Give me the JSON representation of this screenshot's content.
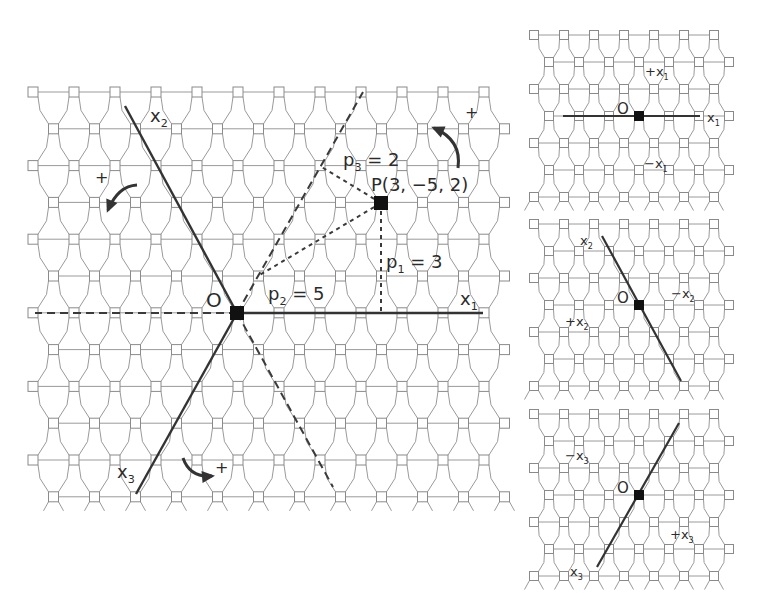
{
  "colors": {
    "background": "#ffffff",
    "lattice_line": "#9a9a9a",
    "node_fill": "#ffffff",
    "node_stroke": "#8a8a8a",
    "axis": "#333333",
    "dashed": "#3a3a3a",
    "marker": "#111111",
    "text": "#2b2b2b"
  },
  "main_panel": {
    "lattice": {
      "rows": 12,
      "cols": 12,
      "x0": 33,
      "y0": 92,
      "dx": 41,
      "dy": 36.8,
      "node_size": 10,
      "odd_row_offset": 20.5
    },
    "origin": {
      "label": "O",
      "x": 237,
      "y": 313
    },
    "point": {
      "label": "P(3, −5, 2)",
      "x": 381,
      "y": 203
    },
    "axes": [
      {
        "name": "x1",
        "label": "x",
        "sub": "1",
        "from": [
          237,
          313
        ],
        "to": [
          483,
          313
        ],
        "label_pos": [
          460,
          305
        ]
      },
      {
        "name": "x2",
        "label": "x",
        "sub": "2",
        "from": [
          237,
          313
        ],
        "to": [
          125,
          106
        ],
        "label_pos": [
          150,
          122
        ]
      },
      {
        "name": "x3",
        "label": "x",
        "sub": "3",
        "from": [
          237,
          313
        ],
        "to": [
          136,
          494
        ],
        "label_pos": [
          117,
          478
        ]
      }
    ],
    "dashed_extensions": [
      {
        "name": "neg-x1",
        "from": [
          237,
          313
        ],
        "to": [
          35,
          313
        ]
      },
      {
        "name": "x3-extension",
        "from": [
          237,
          313
        ],
        "to": [
          363,
          92
        ]
      },
      {
        "name": "x2-extension",
        "from": [
          237,
          313
        ],
        "to": [
          333,
          487
        ]
      }
    ],
    "projections": [
      {
        "name": "p1",
        "label": "p",
        "sub": "1",
        "value": "= 3",
        "from": [
          381,
          203
        ],
        "to": [
          381,
          313
        ],
        "label_pos": [
          386,
          268
        ]
      },
      {
        "name": "p2",
        "label": "p",
        "sub": "2",
        "value": "= 5",
        "from": [
          381,
          203
        ],
        "to": [
          258,
          276
        ],
        "label_pos": [
          268,
          300
        ]
      },
      {
        "name": "p3",
        "label": "p",
        "sub": "3",
        "value": "= 2",
        "from": [
          381,
          203
        ],
        "to": [
          320,
          166
        ],
        "label_pos": [
          343,
          166
        ]
      }
    ],
    "rotation_arrows": [
      {
        "name": "rotation-arrow-top-right",
        "sign": "+",
        "sign_pos": [
          465,
          118
        ],
        "path": "M458 168 Q462 140 434 128",
        "head": [
          434,
          128
        ]
      },
      {
        "name": "rotation-arrow-left",
        "sign": "+",
        "sign_pos": [
          95,
          183
        ],
        "path": "M137 185 Q118 186 108 210",
        "head": [
          108,
          210
        ]
      },
      {
        "name": "rotation-arrow-bottom",
        "sign": "+",
        "sign_pos": [
          215,
          473
        ],
        "path": "M183 458 Q190 478 212 476",
        "head": [
          212,
          476
        ]
      }
    ]
  },
  "side_panels": [
    {
      "name": "x1-panel",
      "lattice": {
        "rows": 7,
        "cols": 7,
        "x0": 534,
        "y0": 35,
        "dx": 30,
        "dy": 27,
        "node_size": 9,
        "odd_row_offset": 15
      },
      "origin": {
        "label": "O",
        "x": 639,
        "y": 116
      },
      "axis": {
        "from": [
          563,
          116
        ],
        "to": [
          700,
          116
        ],
        "label": "x",
        "sub": "1",
        "label_pos": [
          707,
          122
        ]
      },
      "labels": [
        {
          "text": "+x",
          "sub": "1",
          "pos": [
            645,
            76
          ]
        },
        {
          "text": "−x",
          "sub": "1",
          "pos": [
            644,
            168
          ]
        }
      ]
    },
    {
      "name": "x2-panel",
      "lattice": {
        "rows": 7,
        "cols": 7,
        "x0": 534,
        "y0": 224,
        "dx": 30,
        "dy": 27,
        "node_size": 9,
        "odd_row_offset": 15
      },
      "origin": {
        "label": "O",
        "x": 639,
        "y": 305
      },
      "axis": {
        "from": [
          602,
          236
        ],
        "to": [
          681,
          381
        ],
        "label": "x",
        "sub": "2",
        "label_pos": [
          580,
          245
        ]
      },
      "labels": [
        {
          "text": "−x",
          "sub": "2",
          "pos": [
            671,
            298
          ]
        },
        {
          "text": "+x",
          "sub": "2",
          "pos": [
            565,
            326
          ]
        }
      ]
    },
    {
      "name": "x3-panel",
      "lattice": {
        "rows": 7,
        "cols": 7,
        "x0": 534,
        "y0": 414,
        "dx": 30,
        "dy": 27,
        "node_size": 9,
        "odd_row_offset": 15
      },
      "origin": {
        "label": "O",
        "x": 639,
        "y": 495
      },
      "axis": {
        "from": [
          679,
          423
        ],
        "to": [
          597,
          567
        ],
        "label": "x",
        "sub": "3",
        "label_pos": [
          570,
          576
        ]
      },
      "labels": [
        {
          "text": "−x",
          "sub": "3",
          "pos": [
            565,
            460
          ]
        },
        {
          "text": "+x",
          "sub": "3",
          "pos": [
            670,
            539
          ]
        }
      ]
    }
  ]
}
